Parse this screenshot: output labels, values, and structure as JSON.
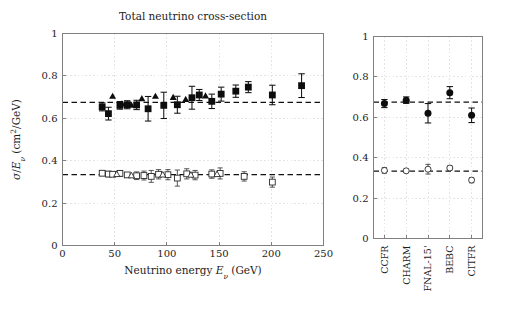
{
  "figure": {
    "title": "Total neutrino cross-section",
    "width": 508,
    "height": 314,
    "background": "#ffffff"
  },
  "chart_data": [
    {
      "id": "left-panel",
      "type": "scatter",
      "title": "Total neutrino cross-section",
      "xlabel": "Neutrino energy E_nu (GeV)",
      "xlabel_parts": {
        "pre": "Neutrino energy ",
        "sym": "E",
        "sub": "ν",
        "post": " (GeV)"
      },
      "ylabel": "sigma/E_nu (cm^2/GeV)",
      "ylabel_parts": {
        "sym1": "σ",
        "slash": "/",
        "sym2": "E",
        "sub": "ν",
        "post": " (cm",
        "sup": "2",
        "post2": "/GeV)"
      },
      "xlim": [
        0,
        250
      ],
      "ylim": [
        0,
        1
      ],
      "xticks": [
        0,
        50,
        100,
        150,
        200,
        250
      ],
      "xticklabels": [
        "0",
        "50",
        "100",
        "150",
        "200",
        "250"
      ],
      "yticks": [
        0,
        0.2,
        0.4,
        0.6,
        0.8,
        1
      ],
      "yticklabels": [
        "0",
        "0.2",
        "0.4",
        "0.6",
        "0.8",
        "1"
      ],
      "grid": true,
      "reference_lines": [
        {
          "name": "neutrino-reference",
          "y": 0.675,
          "style": "dashed"
        },
        {
          "name": "antineutrino-reference",
          "y": 0.334,
          "style": "dashed"
        }
      ],
      "series": [
        {
          "name": "neutrino-squares",
          "marker": "filled-square",
          "points": [
            {
              "x": 38,
              "y": 0.654,
              "yerr": 0.019
            },
            {
              "x": 44,
              "y": 0.622,
              "yerr": 0.03
            },
            {
              "x": 55,
              "y": 0.661,
              "yerr": 0.018
            },
            {
              "x": 62,
              "y": 0.664,
              "yerr": 0.019
            },
            {
              "x": 71,
              "y": 0.663,
              "yerr": 0.022
            },
            {
              "x": 82,
              "y": 0.645,
              "yerr": 0.058
            },
            {
              "x": 97,
              "y": 0.661,
              "yerr": 0.062
            },
            {
              "x": 110,
              "y": 0.664,
              "yerr": 0.04
            },
            {
              "x": 124,
              "y": 0.697,
              "yerr": 0.054
            },
            {
              "x": 131,
              "y": 0.71,
              "yerr": 0.026
            },
            {
              "x": 143,
              "y": 0.68,
              "yerr": 0.034
            },
            {
              "x": 152,
              "y": 0.714,
              "yerr": 0.033
            },
            {
              "x": 166,
              "y": 0.728,
              "yerr": 0.029
            },
            {
              "x": 178,
              "y": 0.747,
              "yerr": 0.026
            },
            {
              "x": 201,
              "y": 0.71,
              "yerr": 0.046
            },
            {
              "x": 229,
              "y": 0.754,
              "yerr": 0.056
            }
          ]
        },
        {
          "name": "neutrino-triangles",
          "marker": "filled-triangle",
          "points": [
            {
              "x": 48,
              "y": 0.704,
              "yerr": 0.0
            },
            {
              "x": 57,
              "y": 0.668,
              "yerr": 0.0
            },
            {
              "x": 66,
              "y": 0.662,
              "yerr": 0.0
            },
            {
              "x": 76,
              "y": 0.693,
              "yerr": 0.0
            },
            {
              "x": 89,
              "y": 0.704,
              "yerr": 0.0
            },
            {
              "x": 106,
              "y": 0.699,
              "yerr": 0.0
            },
            {
              "x": 118,
              "y": 0.689,
              "yerr": 0.0
            },
            {
              "x": 137,
              "y": 0.706,
              "yerr": 0.0
            }
          ]
        },
        {
          "name": "antineutrino-squares",
          "marker": "open-square",
          "points": [
            {
              "x": 38,
              "y": 0.341,
              "yerr": 0.012
            },
            {
              "x": 44,
              "y": 0.337,
              "yerr": 0.013
            },
            {
              "x": 48,
              "y": 0.336,
              "yerr": 0.01
            },
            {
              "x": 55,
              "y": 0.34,
              "yerr": 0.014
            },
            {
              "x": 62,
              "y": 0.333,
              "yerr": 0.01
            },
            {
              "x": 71,
              "y": 0.329,
              "yerr": 0.018
            },
            {
              "x": 78,
              "y": 0.33,
              "yerr": 0.021
            },
            {
              "x": 85,
              "y": 0.326,
              "yerr": 0.028
            },
            {
              "x": 92,
              "y": 0.336,
              "yerr": 0.022
            },
            {
              "x": 101,
              "y": 0.334,
              "yerr": 0.024
            },
            {
              "x": 110,
              "y": 0.318,
              "yerr": 0.038
            },
            {
              "x": 119,
              "y": 0.338,
              "yerr": 0.024
            },
            {
              "x": 127,
              "y": 0.332,
              "yerr": 0.022
            },
            {
              "x": 143,
              "y": 0.337,
              "yerr": 0.02
            },
            {
              "x": 151,
              "y": 0.34,
              "yerr": 0.026
            },
            {
              "x": 174,
              "y": 0.326,
              "yerr": 0.022
            },
            {
              "x": 201,
              "y": 0.299,
              "yerr": 0.024
            }
          ]
        },
        {
          "name": "antineutrino-triangles",
          "marker": "open-triangle",
          "points": [
            {
              "x": 52,
              "y": 0.336,
              "yerr": 0.0
            },
            {
              "x": 66,
              "y": 0.33,
              "yerr": 0.0
            },
            {
              "x": 96,
              "y": 0.334,
              "yerr": 0.0
            },
            {
              "x": 123,
              "y": 0.333,
              "yerr": 0.0
            },
            {
              "x": 148,
              "y": 0.336,
              "yerr": 0.0
            }
          ]
        }
      ]
    },
    {
      "id": "right-panel",
      "type": "scatter",
      "title": "",
      "xlabel": "",
      "ylabel": "",
      "ylim": [
        0,
        1
      ],
      "yticks": [
        0,
        0.2,
        0.4,
        0.6,
        0.8,
        1
      ],
      "yticklabels": [
        "0",
        "0.2",
        "0.4",
        "0.6",
        "0.8",
        "1"
      ],
      "grid": true,
      "categories": [
        "CCFR",
        "CHARM",
        "FNAL-15'",
        "BEBC",
        "CITFR"
      ],
      "reference_lines": [
        {
          "name": "neutrino-reference",
          "y": 0.675,
          "style": "dashed"
        },
        {
          "name": "antineutrino-reference",
          "y": 0.334,
          "style": "dashed"
        }
      ],
      "series": [
        {
          "name": "neutrino-experiments",
          "marker": "filled-circle",
          "values": [
            0.668,
            0.685,
            0.62,
            0.722,
            0.61
          ],
          "errors": [
            0.02,
            0.016,
            0.048,
            0.03,
            0.036
          ]
        },
        {
          "name": "antineutrino-experiments",
          "marker": "open-circle",
          "values": [
            0.337,
            0.335,
            0.343,
            0.349,
            0.289
          ],
          "errors": [
            0.014,
            0.009,
            0.024,
            0.011,
            0.013
          ]
        }
      ]
    }
  ]
}
